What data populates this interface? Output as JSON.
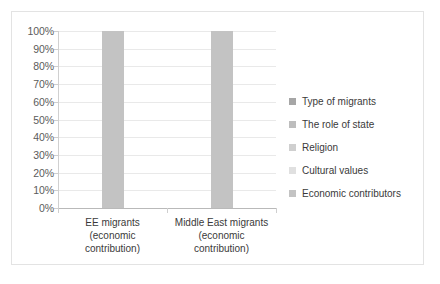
{
  "chart_data": {
    "type": "bar",
    "title": "",
    "subtitle": "",
    "xlabel": "",
    "ylabel": "",
    "categories": [
      "EE migrants (economic contribution)",
      "Middle East migrants (economic contribution)"
    ],
    "category_lines": [
      [
        "EE migrants",
        "(economic",
        "contribution)"
      ],
      [
        "Middle East migrants",
        "(economic",
        "contribution)"
      ]
    ],
    "series": [
      {
        "name": "Type of migrants",
        "values": [
          0,
          0
        ],
        "color": "#a6a6a6"
      },
      {
        "name": "The role of state",
        "values": [
          0,
          0
        ],
        "color": "#bdbdbd"
      },
      {
        "name": "Religion",
        "values": [
          0,
          0
        ],
        "color": "#cfcfcf"
      },
      {
        "name": "Cultural values",
        "values": [
          0,
          0
        ],
        "color": "#e0e0e0"
      },
      {
        "name": "Economic contributors",
        "values": [
          100,
          100
        ],
        "color": "#c3c3c3"
      }
    ],
    "values": [
      100,
      100
    ],
    "bar_color": "#c3c3c3",
    "ylim": [
      0,
      100
    ],
    "ytick_labels": [
      "100%",
      "90%",
      "80%",
      "70%",
      "60%",
      "50%",
      "40%",
      "30%",
      "20%",
      "10%",
      "0%"
    ],
    "ytick_values": [
      100,
      90,
      80,
      70,
      60,
      50,
      40,
      30,
      20,
      10,
      0
    ],
    "grid": true,
    "grid_color": "#e9e9e9",
    "legend_position": "right",
    "legend": [
      "Type of migrants",
      "The role of state",
      "Religion",
      "Cultural values",
      "Economic contributors"
    ],
    "frame_color": "#e3e3e3",
    "axis_color": "#b9b9b9",
    "tick_label_color": "#5b5b5b"
  }
}
